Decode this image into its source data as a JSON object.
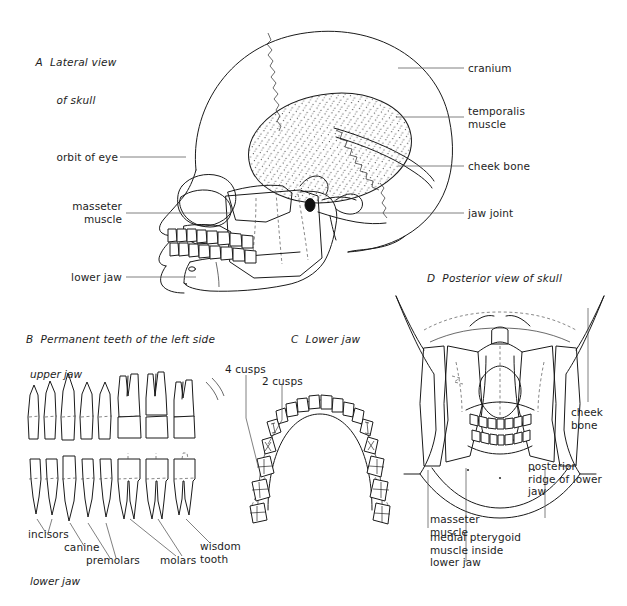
{
  "figure": {
    "background": "#ffffff",
    "ink": "#1a1a1a",
    "lead_line_color": "#555555"
  },
  "panels": {
    "a": {
      "id": "A",
      "title_line1": "A  Lateral view",
      "title_line2": "of skull",
      "labels_left": [
        {
          "name": "orbit-of-eye",
          "text": "orbit of eye"
        },
        {
          "name": "masseter-muscle",
          "text": "masseter\nmuscle"
        },
        {
          "name": "lower-jaw",
          "text": "lower jaw"
        }
      ],
      "labels_right": [
        {
          "name": "cranium",
          "text": "cranium"
        },
        {
          "name": "temporalis-muscle",
          "text": "temporalis\nmuscle"
        },
        {
          "name": "cheek-bone",
          "text": "cheek bone"
        },
        {
          "name": "jaw-joint",
          "text": "jaw joint"
        }
      ]
    },
    "b": {
      "id": "B",
      "title": "B  Permanent teeth of the left side",
      "upper_jaw_label": "upper jaw",
      "lower_jaw_label": "lower jaw",
      "tooth_labels": [
        {
          "name": "incisors",
          "text": "incisors"
        },
        {
          "name": "canine",
          "text": "canine"
        },
        {
          "name": "premolars",
          "text": "premolars"
        },
        {
          "name": "molars",
          "text": "molars"
        },
        {
          "name": "wisdom-tooth",
          "text": "wisdom\ntooth"
        }
      ]
    },
    "c": {
      "id": "C",
      "title": "C  Lower jaw",
      "cusp_labels": [
        {
          "name": "four-cusps",
          "text": "4 cusps"
        },
        {
          "name": "two-cusps",
          "text": "2 cusps"
        }
      ]
    },
    "d": {
      "id": "D",
      "title": "D  Posterior view of skull",
      "labels": [
        {
          "name": "cheek-bone",
          "text": "cheek\nbone"
        },
        {
          "name": "posterior-ridge-of-lower-jaw",
          "text": "posterior\nridge of lower\njaw"
        },
        {
          "name": "masseter-muscle",
          "text": "masseter\nmuscle"
        },
        {
          "name": "medial-pterygoid-muscle",
          "text": "medial pterygoid\nmuscle inside\nlower jaw"
        }
      ]
    }
  }
}
